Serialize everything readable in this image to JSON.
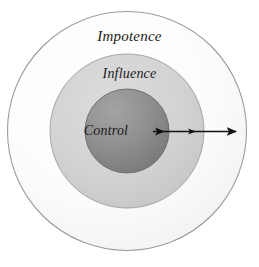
{
  "diagram": {
    "type": "concentric-circles",
    "background_color": "#ffffff",
    "center": {
      "x": 127,
      "y": 131
    },
    "rings": [
      {
        "id": "impotence",
        "label": "Impotence",
        "radius": 120,
        "fill_color": "#fbfbfb",
        "stroke_color": "#9a9a9a",
        "label_position": "top-inside"
      },
      {
        "id": "influence",
        "label": "Influence",
        "radius": 77,
        "fill_color": "#d2d2d2",
        "stroke_color": "#9a9a9a",
        "label_position": "top-inside"
      },
      {
        "id": "control",
        "label": "Control",
        "radius": 42,
        "fill_color": "#8b8b8b",
        "stroke_color": "#6e6e6e",
        "label_position": "center"
      }
    ],
    "arrow": {
      "id": "outward-arrow",
      "color": "#111111",
      "direction": "rightward-outward",
      "start_x": 152,
      "end_x": 238,
      "y": 131,
      "arrowhead_count": 3,
      "arrowhead_positions": [
        164,
        196,
        237
      ],
      "description": "Arrow pointing outward from Control through Influence to Impotence"
    }
  }
}
